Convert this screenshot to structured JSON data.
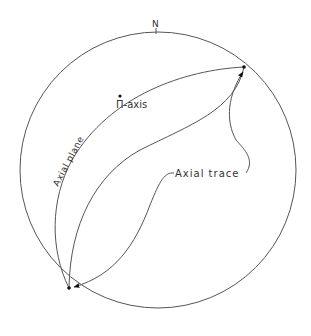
{
  "diagram": {
    "north_label": "N",
    "labels": {
      "pi_axis": "Π-axis",
      "axial_plane": "Axial plane",
      "axial_trace": "Axial trace"
    },
    "colors": {
      "stroke": "#555555",
      "text": "#333333",
      "dot": "#111111"
    }
  }
}
